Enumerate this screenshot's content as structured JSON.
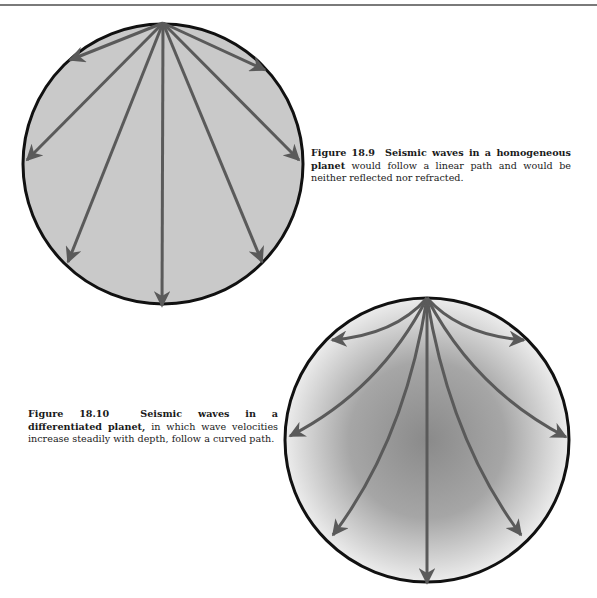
{
  "figures": [
    {
      "label": "Figure 18.9",
      "title": "Seismic waves in a homogeneous",
      "title_bold_cont": "planet",
      "body": " would follow a linear path and would be neither reflected nor refracted.",
      "diagram": {
        "type": "straight-ray-circle",
        "fill": "#c9c9c9",
        "center": [
          163,
          164
        ],
        "radius": 140,
        "source": [
          163,
          23
        ],
        "ray_ends": [
          [
            70,
            60
          ],
          [
            27,
            160
          ],
          [
            68,
            262
          ],
          [
            162,
            306
          ],
          [
            265,
            70
          ],
          [
            299,
            160
          ],
          [
            262,
            262
          ]
        ]
      }
    },
    {
      "label": "Figure 18.10",
      "title": "Seismic waves in a differentiated",
      "title_bold_cont": "planet,",
      "body": " in which wave velocities increase steadily with depth, follow a curved path.",
      "diagram": {
        "type": "curved-ray-circle",
        "fill_outer": "#e6e6e6",
        "fill_inner": "#8c8c8c",
        "center": [
          427,
          440
        ],
        "radius": 142,
        "source": [
          427,
          298
        ],
        "ray_ends": [
          [
            332,
            340
          ],
          [
            290,
            436
          ],
          [
            333,
            535
          ],
          [
            427,
            583
          ],
          [
            524,
            340
          ],
          [
            566,
            437
          ],
          [
            521,
            535
          ]
        ]
      }
    }
  ],
  "colors": {
    "ray": "#5a5a5a",
    "outline": "#111111"
  }
}
